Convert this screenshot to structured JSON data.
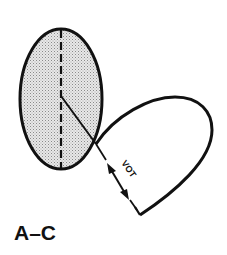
{
  "figure": {
    "panel_label": "A–C",
    "annotation": "VOT",
    "colors": {
      "stroke": "#111111",
      "shade": "#c8c8c8",
      "background": "#ffffff"
    },
    "elements": {
      "ellipse": {
        "cx": 61,
        "cy": 99,
        "rx": 42,
        "ry": 70,
        "shaded": true
      },
      "vertical_axis": {
        "style": "dashed"
      },
      "radius_line": {
        "style": "solid"
      },
      "loop_curve": {
        "style": "solid"
      },
      "vot_arrow": {
        "type": "double-headed"
      }
    }
  }
}
